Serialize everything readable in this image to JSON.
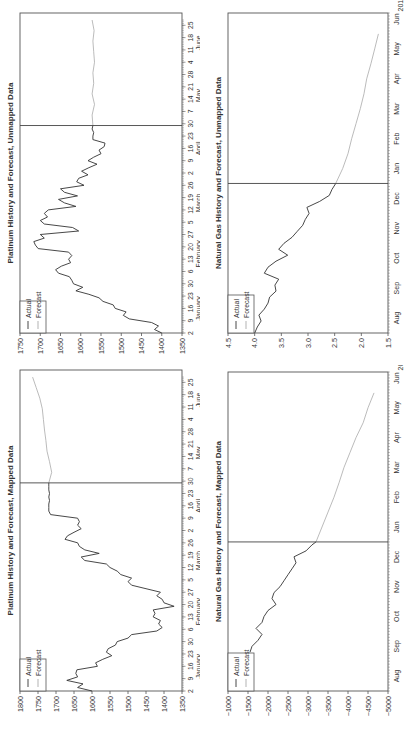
{
  "chart_data": [
    {
      "id": "platinum-unmapped",
      "type": "line",
      "title": "Platinum History and Forecast, Unmapped Data",
      "xlabel": "",
      "ylabel": "",
      "ylim": [
        1350,
        1750
      ],
      "yticks": [
        1350,
        1400,
        1450,
        1500,
        1550,
        1600,
        1650,
        1700,
        1750
      ],
      "x_day_ticks": [
        "2",
        "9",
        "16",
        "23",
        "30",
        "6",
        "13",
        "20",
        "27",
        "5",
        "12",
        "19",
        "26",
        "2",
        "9",
        "16",
        "23",
        "30",
        "7",
        "14",
        "21",
        "28",
        "4",
        "11",
        "18",
        "25"
      ],
      "x_month_labels": [
        "January",
        "February",
        "March",
        "April",
        "May",
        "June"
      ],
      "forecast_start": "April 30",
      "legend": {
        "position": "upper-left",
        "entries": [
          "Actual",
          "Forecast"
        ]
      },
      "series": [
        {
          "name": "Actual",
          "color": "#333333",
          "x": [
            0,
            2,
            4,
            6,
            8,
            10,
            12,
            14,
            16,
            18,
            20,
            22,
            24,
            26,
            28,
            30,
            32,
            34,
            36,
            38,
            40,
            42,
            44,
            46,
            48,
            50,
            52,
            54,
            56,
            58,
            60,
            62,
            64,
            66,
            68,
            70,
            72,
            74,
            76,
            78,
            80,
            82,
            84,
            86,
            88,
            90,
            92,
            94,
            96,
            98,
            100,
            102,
            104,
            106,
            108,
            110,
            112,
            114,
            116,
            118
          ],
          "values": [
            1400,
            1418,
            1408,
            1425,
            1480,
            1495,
            1488,
            1515,
            1520,
            1545,
            1555,
            1580,
            1612,
            1595,
            1618,
            1622,
            1628,
            1655,
            1662,
            1648,
            1625,
            1630,
            1622,
            1630,
            1705,
            1712,
            1716,
            1690,
            1700,
            1605,
            1620,
            1690,
            1700,
            1682,
            1690,
            1680,
            1612,
            1640,
            1655,
            1608,
            1640,
            1650,
            1592,
            1610,
            1605,
            1582,
            1598,
            1580,
            1560,
            1582,
            1568,
            1550,
            1555,
            1542,
            1540,
            1570,
            1570,
            1568,
            1572,
            1570
          ]
        },
        {
          "name": "Forecast",
          "color": "#aaaaaa",
          "x": [
            118,
            124,
            130,
            136,
            142,
            148,
            154,
            160,
            166,
            172,
            178
          ],
          "values": [
            1570,
            1572,
            1566,
            1572,
            1568,
            1570,
            1566,
            1568,
            1570,
            1567,
            1572
          ]
        }
      ]
    },
    {
      "id": "natural-gas-unmapped",
      "type": "line",
      "title": "Natural Gas History and Forecast, Unmapped Data",
      "xlabel": "",
      "ylabel": "",
      "ylim": [
        1.5,
        4.5
      ],
      "yticks": [
        1.5,
        2.0,
        2.5,
        3.0,
        3.5,
        4.0,
        4.5
      ],
      "x_month_labels": [
        "Aug",
        "Sep",
        "Oct",
        "Nov",
        "Dec",
        "Jan",
        "Feb",
        "Mar",
        "Apr",
        "May",
        "Jun"
      ],
      "x_year_label": "2012",
      "forecast_start": "Jan",
      "legend": {
        "position": "upper-left",
        "entries": [
          "Actual",
          "Forecast"
        ]
      },
      "series": [
        {
          "name": "Actual",
          "color": "#333333",
          "x": [
            0.0,
            0.2,
            0.4,
            0.6,
            0.8,
            1.0,
            1.2,
            1.4,
            1.6,
            1.8,
            2.0,
            2.2,
            2.4,
            2.6,
            2.8,
            3.0,
            3.2,
            3.4,
            3.6,
            3.8,
            4.0,
            4.2,
            4.4,
            4.6,
            4.8,
            5.0
          ],
          "values": [
            4.0,
            3.95,
            3.88,
            3.92,
            3.82,
            3.75,
            3.72,
            3.6,
            3.62,
            3.55,
            3.82,
            3.75,
            3.6,
            3.38,
            3.55,
            3.45,
            3.3,
            3.2,
            3.1,
            3.05,
            2.98,
            3.02,
            2.78,
            2.6,
            2.55,
            2.48
          ]
        },
        {
          "name": "Forecast",
          "color": "#aaaaaa",
          "x": [
            5.0,
            5.5,
            6.0,
            6.5,
            7.0,
            7.5,
            8.0,
            8.5,
            9.0,
            9.5,
            10.0
          ],
          "values": [
            2.48,
            2.35,
            2.25,
            2.18,
            2.1,
            2.02,
            1.95,
            1.9,
            1.82,
            1.75,
            1.68
          ]
        }
      ]
    },
    {
      "id": "platinum-mapped",
      "type": "line",
      "title": "Platinum History and Forecast, Mapped Data",
      "xlabel": "",
      "ylabel": "",
      "ylim": [
        1350,
        1800
      ],
      "yticks": [
        1350,
        1400,
        1450,
        1500,
        1550,
        1600,
        1650,
        1700,
        1750,
        1800
      ],
      "x_day_ticks": [
        "2",
        "9",
        "16",
        "23",
        "30",
        "6",
        "13",
        "20",
        "27",
        "5",
        "12",
        "19",
        "26",
        "2",
        "9",
        "16",
        "23",
        "30",
        "7",
        "14",
        "21",
        "28",
        "4",
        "11",
        "18",
        "25"
      ],
      "x_month_labels": [
        "January",
        "February",
        "March",
        "April",
        "May",
        "June"
      ],
      "forecast_start": "April 30",
      "legend": {
        "position": "upper-left",
        "entries": [
          "Actual",
          "Forecast"
        ]
      },
      "series": [
        {
          "name": "Actual",
          "color": "#333333",
          "x": [
            0,
            2,
            4,
            6,
            8,
            10,
            12,
            14,
            16,
            18,
            20,
            22,
            24,
            26,
            28,
            30,
            32,
            34,
            36,
            38,
            40,
            42,
            44,
            46,
            48,
            50,
            52,
            54,
            56,
            58,
            60,
            62,
            64,
            66,
            68,
            70,
            72,
            74,
            76,
            78,
            80,
            82,
            84,
            86,
            88,
            90,
            92,
            94,
            96,
            98,
            100,
            102,
            104,
            106,
            108,
            110,
            112,
            114,
            116,
            118
          ],
          "values": [
            1600,
            1640,
            1625,
            1670,
            1640,
            1645,
            1642,
            1585,
            1590,
            1570,
            1545,
            1560,
            1555,
            1535,
            1530,
            1500,
            1490,
            1420,
            1405,
            1415,
            1410,
            1430,
            1425,
            1430,
            1372,
            1400,
            1405,
            1420,
            1410,
            1450,
            1490,
            1500,
            1490,
            1520,
            1530,
            1550,
            1560,
            1620,
            1630,
            1580,
            1620,
            1635,
            1640,
            1675,
            1668,
            1650,
            1630,
            1640,
            1635,
            1640,
            1715,
            1720,
            1720,
            1720,
            1718,
            1720,
            1718,
            1720,
            1720,
            1720
          ]
        },
        {
          "name": "Forecast",
          "color": "#aaaaaa",
          "x": [
            118,
            124,
            130,
            136,
            142,
            148,
            154,
            160,
            166,
            172,
            178
          ],
          "values": [
            1720,
            1712,
            1718,
            1725,
            1728,
            1732,
            1735,
            1738,
            1745,
            1755,
            1765
          ]
        }
      ]
    },
    {
      "id": "natural-gas-mapped",
      "type": "line",
      "title": "Natural Gas History and Forecast, Mapped Data",
      "xlabel": "",
      "ylabel": "",
      "ylim": [
        -5000,
        -1000
      ],
      "yticks": [
        -5000,
        -4500,
        -4000,
        -3500,
        -3000,
        -2500,
        -2000,
        -1500,
        -1000
      ],
      "x_month_labels": [
        "Aug",
        "Sep",
        "Oct",
        "Nov",
        "Dec",
        "Jan",
        "Feb",
        "Mar",
        "Apr",
        "May",
        "Jun"
      ],
      "x_year_label": "2012",
      "forecast_start": "Jan",
      "legend": {
        "position": "upper-left",
        "entries": [
          "Actual",
          "Forecast"
        ]
      },
      "series": [
        {
          "name": "Actual",
          "color": "#333333",
          "x": [
            1.3,
            1.5,
            1.7,
            1.9,
            2.1,
            2.3,
            2.5,
            2.7,
            2.9,
            3.1,
            3.3,
            3.5,
            3.7,
            3.9,
            4.1,
            4.3,
            4.5,
            4.7,
            4.9,
            5.0
          ],
          "values": [
            -1550,
            -1600,
            -1750,
            -1850,
            -1700,
            -1850,
            -1900,
            -2000,
            -2200,
            -2100,
            -2150,
            -2300,
            -2400,
            -2500,
            -2600,
            -2700,
            -2650,
            -2950,
            -3100,
            -3200
          ]
        },
        {
          "name": "Forecast",
          "color": "#aaaaaa",
          "x": [
            5.0,
            5.5,
            6.0,
            6.5,
            7.0,
            7.5,
            8.0,
            8.5,
            9.0,
            9.5,
            10.0
          ],
          "values": [
            -3200,
            -3350,
            -3500,
            -3650,
            -3780,
            -3900,
            -4050,
            -4200,
            -4380,
            -4500,
            -4650
          ]
        }
      ]
    }
  ],
  "legend": {
    "actual": "Actual",
    "forecast": "Forecast"
  },
  "charts": {
    "pt_unmapped": {
      "title": "Platinum History and Forecast, Unmapped Data"
    },
    "ng_unmapped": {
      "title": "Natural Gas History and Forecast, Unmapped Data"
    },
    "pt_mapped": {
      "title": "Platinum History and Forecast, Mapped Data"
    },
    "ng_mapped": {
      "title": "Natural Gas History and Forecast, Mapped Data"
    }
  },
  "colors": {
    "actual": "#333333",
    "forecast": "#aaaaaa",
    "axis": "#555555"
  }
}
